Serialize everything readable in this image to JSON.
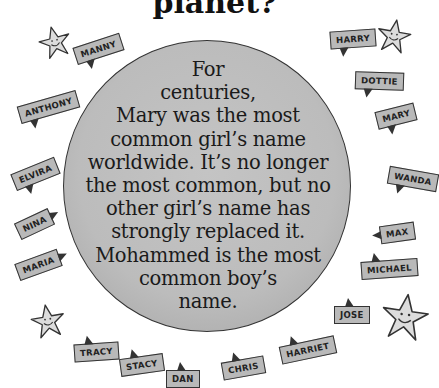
{
  "title": "planet?",
  "globe": {
    "lines": [
      "For",
      "centuries,",
      "Mary was the most",
      "common girl’s name",
      "worldwide. It’s no longer",
      "the most common, but no",
      "other girl’s name has",
      "strongly replaced it.",
      "Mohammed is the most",
      "common boy’s",
      "name."
    ]
  },
  "bubbles": [
    {
      "name": "MANNY"
    },
    {
      "name": "HARRY"
    },
    {
      "name": "ANTHONY"
    },
    {
      "name": "DOTTIE"
    },
    {
      "name": "MARY"
    },
    {
      "name": "ELVIRA"
    },
    {
      "name": "WANDA"
    },
    {
      "name": "NINA"
    },
    {
      "name": "MAX"
    },
    {
      "name": "MARIA"
    },
    {
      "name": "MICHAEL"
    },
    {
      "name": "JOSE"
    },
    {
      "name": "TRACY"
    },
    {
      "name": "STACY"
    },
    {
      "name": "DAN"
    },
    {
      "name": "CHRIS"
    },
    {
      "name": "HARRIET"
    }
  ],
  "colors": {
    "globe_fill": "#bcbcbc",
    "bubble_fill": "#b9b9b9",
    "star_fill": "#dcdcdc",
    "outline": "#333333"
  }
}
